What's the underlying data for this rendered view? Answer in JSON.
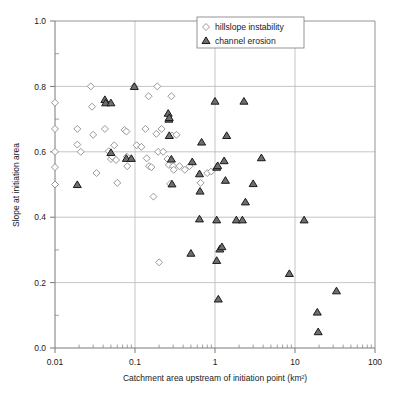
{
  "chart_data": {
    "type": "scatter",
    "title": "",
    "xlabel": "Catchment area upstream of initiation point (km²)",
    "ylabel": "Slope at initiation area",
    "xscale": "log",
    "yscale": "linear",
    "xlim": [
      0.01,
      100
    ],
    "ylim": [
      0.0,
      1.0
    ],
    "grid": true,
    "legend_position": "top-right",
    "xticks": [
      "0.01",
      "0.1",
      "1",
      "10",
      "100"
    ],
    "xtick_values": [
      0.01,
      0.1,
      1,
      10,
      100
    ],
    "yticks": [
      "0.0",
      "0.2",
      "0.4",
      "0.6",
      "0.8",
      "1.0"
    ],
    "ytick_values": [
      0.0,
      0.2,
      0.4,
      0.6,
      0.8,
      1.0
    ],
    "series": [
      {
        "name": "hillslope instability",
        "marker": "diamond",
        "color": "#808080",
        "points": [
          [
            0.01,
            0.75
          ],
          [
            0.01,
            0.67
          ],
          [
            0.01,
            0.6
          ],
          [
            0.01,
            0.553
          ],
          [
            0.01,
            0.5
          ],
          [
            0.019,
            0.67
          ],
          [
            0.019,
            0.622
          ],
          [
            0.021,
            0.6
          ],
          [
            0.028,
            0.8
          ],
          [
            0.029,
            0.738
          ],
          [
            0.03,
            0.652
          ],
          [
            0.033,
            0.535
          ],
          [
            0.042,
            0.67
          ],
          [
            0.047,
            0.602
          ],
          [
            0.05,
            0.578
          ],
          [
            0.052,
            0.585
          ],
          [
            0.055,
            0.62
          ],
          [
            0.058,
            0.575
          ],
          [
            0.06,
            0.505
          ],
          [
            0.074,
            0.667
          ],
          [
            0.078,
            0.662
          ],
          [
            0.079,
            0.585
          ],
          [
            0.08,
            0.556
          ],
          [
            0.098,
            0.8
          ],
          [
            0.105,
            0.62
          ],
          [
            0.12,
            0.615
          ],
          [
            0.135,
            0.67
          ],
          [
            0.14,
            0.58
          ],
          [
            0.148,
            0.77
          ],
          [
            0.15,
            0.556
          ],
          [
            0.16,
            0.553
          ],
          [
            0.17,
            0.463
          ],
          [
            0.185,
            0.655
          ],
          [
            0.19,
            0.8
          ],
          [
            0.195,
            0.6
          ],
          [
            0.2,
            0.262
          ],
          [
            0.215,
            0.67
          ],
          [
            0.225,
            0.6
          ],
          [
            0.255,
            0.578
          ],
          [
            0.265,
            0.56
          ],
          [
            0.275,
            0.502
          ],
          [
            0.285,
            0.77
          ],
          [
            0.29,
            0.65
          ],
          [
            0.3,
            0.556
          ],
          [
            0.305,
            0.545
          ],
          [
            0.33,
            0.652
          ],
          [
            0.36,
            0.556
          ],
          [
            0.42,
            0.545
          ],
          [
            0.48,
            0.556
          ],
          [
            0.66,
            0.505
          ],
          [
            0.8,
            0.535
          ],
          [
            0.9,
            0.54
          ]
        ]
      },
      {
        "name": "channel erosion",
        "marker": "triangle",
        "color": "#1a1a1a",
        "points": [
          [
            0.019,
            0.5
          ],
          [
            0.042,
            0.76
          ],
          [
            0.043,
            0.75
          ],
          [
            0.05,
            0.75
          ],
          [
            0.05,
            0.598
          ],
          [
            0.078,
            0.58
          ],
          [
            0.09,
            0.58
          ],
          [
            0.098,
            0.8
          ],
          [
            0.26,
            0.718
          ],
          [
            0.265,
            0.7
          ],
          [
            0.268,
            0.705
          ],
          [
            0.268,
            0.65
          ],
          [
            0.285,
            0.578
          ],
          [
            0.29,
            0.502
          ],
          [
            0.52,
            0.57
          ],
          [
            0.64,
            0.533
          ],
          [
            0.64,
            0.395
          ],
          [
            0.65,
            0.48
          ],
          [
            0.68,
            0.63
          ],
          [
            0.5,
            0.29
          ],
          [
            1.0,
            0.755
          ],
          [
            1.05,
            0.553
          ],
          [
            1.08,
            0.558
          ],
          [
            1.05,
            0.392
          ],
          [
            1.05,
            0.268
          ],
          [
            1.15,
            0.303
          ],
          [
            1.22,
            0.31
          ],
          [
            1.1,
            0.15
          ],
          [
            1.3,
            0.573
          ],
          [
            1.4,
            0.65
          ],
          [
            1.35,
            0.513
          ],
          [
            1.85,
            0.392
          ],
          [
            2.2,
            0.392
          ],
          [
            2.3,
            0.755
          ],
          [
            2.4,
            0.447
          ],
          [
            3.0,
            0.503
          ],
          [
            3.8,
            0.582
          ],
          [
            8.5,
            0.228
          ],
          [
            13.0,
            0.392
          ],
          [
            19.0,
            0.11
          ],
          [
            19.5,
            0.05
          ],
          [
            33.0,
            0.175
          ]
        ]
      }
    ]
  },
  "legend": {
    "entries": [
      {
        "label": "hillslope instability",
        "marker": "diamond"
      },
      {
        "label": "channel erosion",
        "marker": "triangle"
      }
    ]
  },
  "colors": {
    "frame": "#7a7a7a",
    "grid": "#b8b8b8",
    "diamond_stroke": "#8c8c8c",
    "triangle_stroke": "#1a1a1a",
    "triangle_fill": "#6e6e6e",
    "text": "#1a1a1a",
    "background": "#ffffff"
  }
}
